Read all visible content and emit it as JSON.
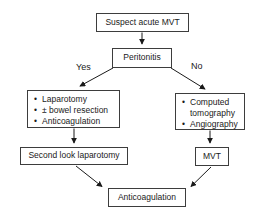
{
  "diagram": {
    "type": "flowchart",
    "topic": "Management algorithm for suspected acute MVT"
  },
  "nodes": {
    "suspect": {
      "label": "Suspect acute MVT"
    },
    "peritonitis": {
      "label": "Peritonitis"
    },
    "surgical_branch": {
      "items": [
        "Laparotomy",
        "± bowel resection",
        "Anticoagulation"
      ]
    },
    "imaging_branch": {
      "items": [
        "Computed tomography",
        "Angiography"
      ]
    },
    "second_look": {
      "label": "Second look laparotomy"
    },
    "mvt": {
      "label": "MVT"
    },
    "anticoagulation": {
      "label": "Anticoagulation"
    }
  },
  "edges": {
    "yes_label": "Yes",
    "no_label": "No"
  },
  "colors": {
    "background": "#ffffff",
    "border": "#3d3d3d",
    "text": "#1a1a1a",
    "arrow": "#1a1a1a"
  }
}
